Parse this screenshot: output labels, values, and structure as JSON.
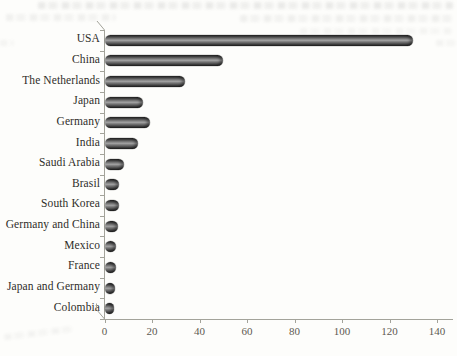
{
  "page": {
    "background": "#fdfdfb",
    "description_artifacts": "faint illegible bleed-through text from reverse side of scanned book page"
  },
  "chart_data": {
    "type": "bar",
    "orientation": "horizontal",
    "style": "3d-cylinder-grayscale",
    "title": "",
    "xlabel": "",
    "ylabel": "",
    "categories": [
      "USA",
      "China",
      "The Netherlands",
      "Japan",
      "Germany",
      "India",
      "Saudi Arabia",
      "Brasil",
      "South Korea",
      "Germany and China",
      "Mexico",
      "France",
      "Japan and Germany",
      "Colombia"
    ],
    "values": [
      130,
      50,
      34,
      16,
      19,
      14,
      8,
      6,
      6,
      5.5,
      5,
      5,
      4.5,
      4
    ],
    "xlim": [
      0,
      140
    ],
    "xticks": [
      0,
      20,
      40,
      60,
      80,
      100,
      120,
      140
    ],
    "grid": false,
    "legend": null,
    "colors": {
      "bar_dark": "#232323",
      "bar_highlight": "#9e9e9e",
      "axis": "#a3a39a",
      "tick_label": "#5d5a52",
      "category_label": "#2f2d29"
    }
  }
}
